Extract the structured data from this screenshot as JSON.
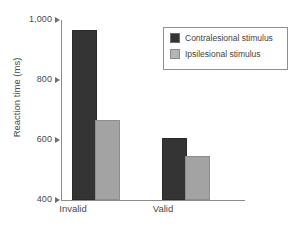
{
  "chart_data": {
    "type": "bar",
    "title": "",
    "xlabel": "",
    "ylabel": "Reaction time (ms)",
    "categories": [
      "Invalid",
      "Valid"
    ],
    "series": [
      {
        "name": "Contralesional stimulus",
        "color": "#343434",
        "values": [
          960,
          600
        ]
      },
      {
        "name": "Ipsilesional stimulus",
        "color": "#a3a3a3",
        "values": [
          660,
          540
        ]
      }
    ],
    "ylim": [
      400,
      1000
    ],
    "yticks": [
      400,
      600,
      800,
      1000
    ],
    "ytick_labels": [
      "400",
      "600",
      "800",
      "1,000"
    ],
    "grid": false,
    "legend_position": "upper-right"
  },
  "legend": {
    "items": [
      {
        "label": "Contralesional stimulus"
      },
      {
        "label": "Ipsilesional stimulus"
      }
    ]
  }
}
